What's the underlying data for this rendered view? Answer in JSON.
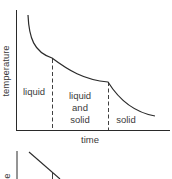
{
  "diagram": {
    "type": "cooling-curve",
    "y_axis_label": "temperature",
    "x_axis_label": "time",
    "regions": [
      {
        "label": "liquid"
      },
      {
        "label_lines": [
          "liquid",
          "and",
          "solid"
        ]
      },
      {
        "label": "solid"
      }
    ],
    "colors": {
      "line": "#2a2a2a",
      "text": "#3a3a3a",
      "background": "#ffffff"
    }
  },
  "second_diagram": {
    "partial": true,
    "y_axis_label_visible_fragment": "e"
  }
}
